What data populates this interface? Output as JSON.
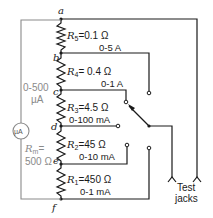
{
  "diagram": {
    "nodes": [
      "a",
      "b",
      "c",
      "d",
      "e",
      "f"
    ],
    "resistors": [
      {
        "name": "R",
        "sub": "5",
        "value": "=0.1 Ω",
        "range": "0-5 A"
      },
      {
        "name": "R",
        "sub": "4",
        "value": "= 0.4 Ω",
        "range": "0-1 A"
      },
      {
        "name": "R",
        "sub": "3",
        "value": "=4.5 Ω",
        "range": "0-100 mA"
      },
      {
        "name": "R",
        "sub": "2",
        "value": "=45 Ω",
        "range": "0-10 mA"
      },
      {
        "name": "R",
        "sub": "1",
        "value": "=450 Ω",
        "range": "0-1 mA"
      }
    ],
    "meter": {
      "symbol": "µA",
      "range_line1": "0-500",
      "range_line2": "µA",
      "rm_label": "R",
      "rm_sub": "m",
      "rm_eq": "=",
      "rm_value": "500 Ω"
    },
    "test_jacks": {
      "line1": "Test",
      "line2": "jacks"
    },
    "colors": {
      "wire": "#1a1a1a",
      "meter_wire": "#8a8a8a"
    }
  }
}
